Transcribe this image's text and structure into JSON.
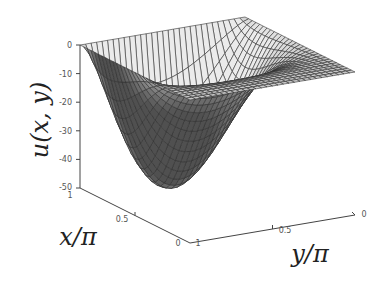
{
  "chart_data": {
    "type": "surface3d",
    "title": "",
    "zlabel": "u(x, y)",
    "xlabel": "x/π",
    "ylabel": "y/π",
    "x_ticks": [
      "0",
      "0.5",
      "1"
    ],
    "y_ticks": [
      "0",
      "0.5",
      "1"
    ],
    "z_ticks": [
      "0",
      "-10",
      "-20",
      "-30",
      "-40",
      "-50"
    ],
    "xlim": [
      0,
      1
    ],
    "ylim": [
      0,
      1
    ],
    "zlim": [
      -50,
      0
    ],
    "grid": "mesh",
    "mesh_resolution": 30,
    "boundary_value": 0,
    "minimum": {
      "x": 0.79,
      "y": 0.59,
      "z": -50
    },
    "surface_model": {
      "K": 50,
      "a": 3.8,
      "b": 1.44
    },
    "colormap": "gray",
    "edge_color": "#333333"
  },
  "labels": {
    "zlabel": "u(x, y)",
    "xlabel": "x/π",
    "ylabel": "y/π"
  },
  "ticks": {
    "z0": "0",
    "z10": "-10",
    "z20": "-20",
    "z30": "-30",
    "z40": "-40",
    "z50": "-50",
    "x1": "1",
    "x05": "0.5",
    "x0": "0",
    "y1": "1",
    "y05": "0.5",
    "y0": "0"
  }
}
